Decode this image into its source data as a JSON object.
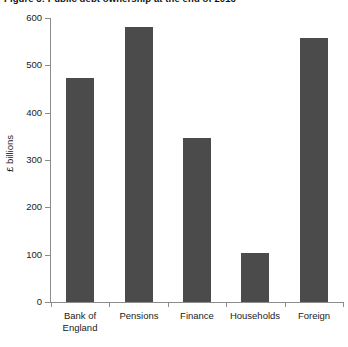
{
  "chart_data": {
    "type": "bar",
    "title": "Figure 3: Public debt ownership at the end of 2016",
    "xlabel": "",
    "ylabel": "£ billions",
    "categories": [
      "Bank of\nEngland",
      "Pensions",
      "Finance",
      "Households",
      "Foreign"
    ],
    "category_lines": [
      [
        "Bank of",
        "England"
      ],
      [
        "Pensions"
      ],
      [
        "Finance"
      ],
      [
        "Households"
      ],
      [
        "Foreign"
      ]
    ],
    "values": [
      473,
      581,
      347,
      104,
      558
    ],
    "ylim": [
      0,
      600
    ],
    "yticks": [
      0,
      100,
      200,
      300,
      400,
      500,
      600
    ],
    "ytick_labels": [
      "0",
      "100",
      "200",
      "300",
      "400",
      "500",
      "600"
    ],
    "grid": false,
    "legend": null,
    "bar_color": "#4b4b4b",
    "axis_color": "#8c8c8c"
  }
}
